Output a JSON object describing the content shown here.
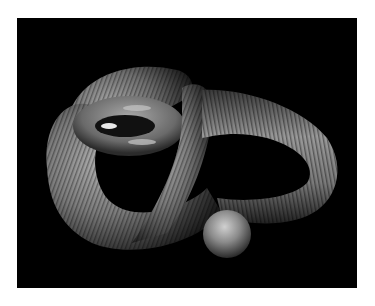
{
  "image": {
    "subject": "3D rendered twisted ribbed tube forming a knot",
    "background_color": "#000000",
    "border_color": "#ffffff",
    "object_color": "#8a8a8a"
  }
}
